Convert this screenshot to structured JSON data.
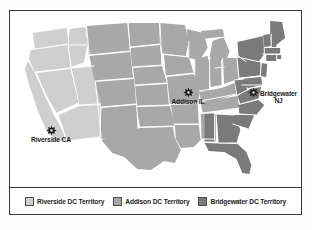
{
  "figure": {
    "type": "territory-map",
    "region": "United States",
    "frame_border_color": "#3a3a3a",
    "background_color": "#ffffff"
  },
  "colors": {
    "riverside": "#cfcfcf",
    "addison": "#a8a8a8",
    "bridgewater": "#7a7a7a",
    "state_border": "#ffffff",
    "text": "#1c1c1c",
    "star": "#1c1c1c"
  },
  "map": {
    "markers": [
      {
        "id": "addison",
        "label": "Addison IL",
        "icon": "star-marker-icon",
        "territory": "Addison DC Territory"
      },
      {
        "id": "bridgewater",
        "label": "Bridgewater\nNJ",
        "icon": "star-marker-icon",
        "territory": "Bridgewater DC Territory"
      },
      {
        "id": "riverside",
        "label": "Riverside CA",
        "icon": "star-marker-icon",
        "territory": "Riverside DC Territory"
      }
    ]
  },
  "legend": {
    "items": [
      {
        "label": "Riverside DC Territory",
        "color": "#cfcfcf"
      },
      {
        "label": "Addison DC Territory",
        "color": "#a8a8a8"
      },
      {
        "label": "Bridgewater DC Territory",
        "color": "#7a7a7a"
      }
    ]
  }
}
